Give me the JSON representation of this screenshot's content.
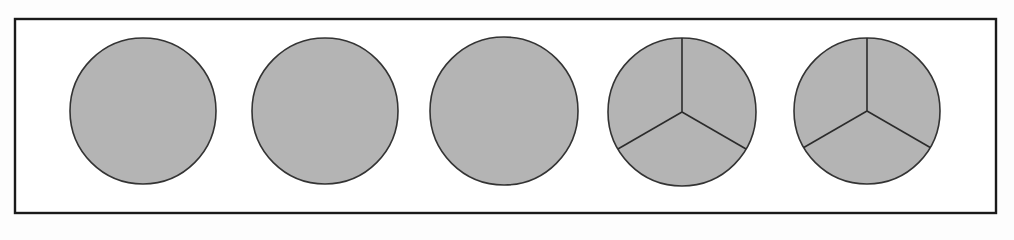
{
  "figure": {
    "canvas": {
      "width": 1014,
      "height": 240
    },
    "background_color": "#fdfdfd",
    "frame": {
      "name": "outer-frame",
      "x": 15,
      "y": 19,
      "width": 981,
      "height": 194,
      "stroke_color": "#1a1a1a",
      "stroke_width": 2.4,
      "fill_color": "#ffffff"
    },
    "shape_style": {
      "fill_color": "#b4b4b4",
      "stroke_color": "#333333",
      "stroke_width": 1.6,
      "divider_color": "#2b2b2b",
      "divider_width": 1.6
    },
    "circles": [
      {
        "id": "circle-1",
        "label": "Whole circle 1",
        "cx": 143,
        "cy": 111,
        "r": 73,
        "parts": 1,
        "divided": false,
        "divider_angles_deg": []
      },
      {
        "id": "circle-2",
        "label": "Whole circle 2",
        "cx": 325,
        "cy": 111,
        "r": 73,
        "parts": 1,
        "divided": false,
        "divider_angles_deg": []
      },
      {
        "id": "circle-3",
        "label": "Whole circle 3",
        "cx": 504,
        "cy": 111,
        "r": 74,
        "parts": 1,
        "divided": false,
        "divider_angles_deg": []
      },
      {
        "id": "circle-4",
        "label": "Circle divided into thirds 1",
        "cx": 682,
        "cy": 112,
        "r": 74,
        "parts": 3,
        "divided": true,
        "divider_angles_deg": [
          90,
          210,
          330
        ]
      },
      {
        "id": "circle-5",
        "label": "Circle divided into thirds 2",
        "cx": 867,
        "cy": 111,
        "r": 73,
        "parts": 3,
        "divided": true,
        "divider_angles_deg": [
          90,
          210,
          330
        ]
      }
    ]
  }
}
